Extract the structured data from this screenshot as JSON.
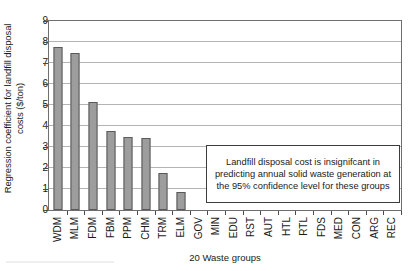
{
  "chart_data": {
    "type": "bar",
    "title": "",
    "xlabel": "20 Waste groups",
    "ylabel": "Regression coefficient for landfill disposal costs ($/ton)",
    "ylabel_line1": "Regression coefficient for landfill disposal",
    "ylabel_line2": "costs ($/ton)",
    "categories": [
      "WDM",
      "MLM",
      "FDM",
      "FBM",
      "PPM",
      "CHM",
      "TRM",
      "ELM",
      "GOV",
      "MIN",
      "EDU",
      "RST",
      "AUT",
      "HTL",
      "RTL",
      "FDS",
      "MED",
      "CON",
      "ARG",
      "REC"
    ],
    "values": [
      7.75,
      7.47,
      5.15,
      3.75,
      3.5,
      3.45,
      1.75,
      0.85,
      0,
      0,
      0,
      0,
      0,
      0,
      0,
      0,
      0,
      0,
      0,
      0
    ],
    "ylim": [
      0,
      9
    ],
    "ytick_labels": [
      "0",
      "1",
      "2",
      "3",
      "4",
      "5",
      "6",
      "7",
      "8",
      "9"
    ],
    "ytick_values": [
      0,
      1,
      2,
      3,
      4,
      5,
      6,
      7,
      8,
      9
    ],
    "grid": true,
    "grid_axis": "y",
    "legend": "none",
    "bar_color": "#9d9d9d",
    "bar_edge_color": "#595959",
    "grid_color": "#b4b4b4",
    "axis_color": "#6e6e6e",
    "annotation": "Landfill disposal cost is insignifcant in predicting annual solid waste generation at the 95% confidence level for these groups"
  }
}
